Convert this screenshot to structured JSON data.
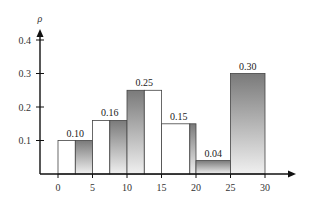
{
  "chart_data": {
    "type": "bar",
    "title": "",
    "xlabel": "",
    "ylabel": "ρ",
    "xlim": [
      0,
      30
    ],
    "ylim": [
      0,
      0.4
    ],
    "x_ticks": [
      "0",
      "5",
      "10",
      "15",
      "20",
      "25",
      "30"
    ],
    "y_ticks": [
      "0.1",
      "0.2",
      "0.3",
      "0.4"
    ],
    "grid": false,
    "legend": null,
    "bins": [
      {
        "range": [
          0,
          5
        ],
        "value": 0.1,
        "label": "0.10"
      },
      {
        "range": [
          5,
          10
        ],
        "value": 0.16,
        "label": "0.16"
      },
      {
        "range": [
          10,
          15
        ],
        "value": 0.25,
        "label": "0.25"
      },
      {
        "range": [
          15,
          20
        ],
        "value": 0.15,
        "label": "0.15"
      },
      {
        "range": [
          20,
          25
        ],
        "value": 0.04,
        "label": "0.04"
      },
      {
        "range": [
          25,
          30
        ],
        "value": 0.3,
        "label": "0.30"
      }
    ],
    "categories": [
      "0-5",
      "5-10",
      "10-15",
      "15-20",
      "20-25",
      "25-30"
    ],
    "values": [
      0.1,
      0.16,
      0.25,
      0.15,
      0.04,
      0.3
    ]
  },
  "colors": {
    "axis": "#111111",
    "gradient_top": "#7a7a7a",
    "gradient_bottom": "#efefef",
    "white_fill": "#ffffff",
    "bar_stroke": "#444444"
  }
}
